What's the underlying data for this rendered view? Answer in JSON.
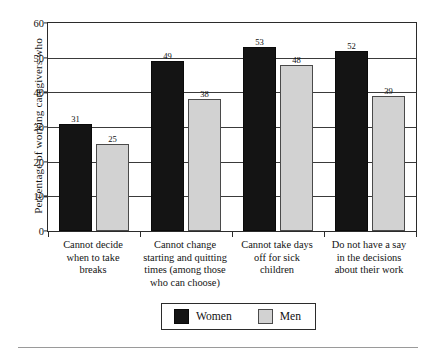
{
  "chart_data": {
    "type": "bar",
    "title": "",
    "xlabel": "",
    "ylabel": "Percentage of working caregivers who",
    "ylim": [
      0,
      60
    ],
    "ytick_labels": [
      "0",
      "10",
      "20",
      "30",
      "40",
      "50",
      "60"
    ],
    "ytick_values": [
      0,
      10,
      20,
      30,
      40,
      50,
      60
    ],
    "grid": "horizontal",
    "legend_position": "bottom-center",
    "categories": [
      "Cannot decide\nwhen to take\nbreaks",
      "Cannot change\nstarting and quitting\ntimes (among those\nwho can choose)",
      "Cannot take days\noff for sick\nchildren",
      "Do not have a say\nin the decisions\nabout their work"
    ],
    "category_lines": [
      [
        "Cannot decide",
        "when to take",
        "breaks"
      ],
      [
        "Cannot change",
        "starting and quitting",
        "times (among those",
        "who can choose)"
      ],
      [
        "Cannot take days",
        "off for sick",
        "children"
      ],
      [
        "Do not have a say",
        "in the decisions",
        "about their work"
      ]
    ],
    "series": [
      {
        "name": "Women",
        "color": "#141414",
        "values": [
          31,
          49,
          53,
          52
        ]
      },
      {
        "name": "Men",
        "color": "#d2d2d2",
        "values": [
          25,
          38,
          48,
          39
        ]
      }
    ]
  },
  "legend": {
    "items": [
      {
        "label": "Women",
        "swatch": "black-square-swatch"
      },
      {
        "label": "Men",
        "swatch": "gray-square-swatch"
      }
    ]
  }
}
